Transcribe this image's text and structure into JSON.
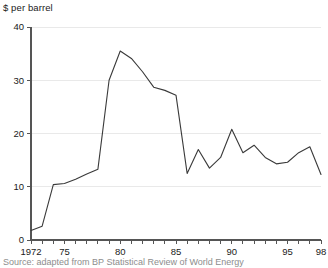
{
  "chart_data": {
    "type": "line",
    "title": "",
    "subtitle": "",
    "ylabel": "$ per barrel",
    "xlabel": "",
    "ylim": [
      0,
      40
    ],
    "xlim": [
      1972,
      1998
    ],
    "yticks": [
      0,
      10,
      20,
      30,
      40
    ],
    "ytick_labels": [
      "0",
      "10",
      "20",
      "30",
      "40"
    ],
    "xticks": [
      1972,
      1975,
      1980,
      1985,
      1990,
      1995,
      1998
    ],
    "xtick_labels": [
      "1972",
      "75",
      "80",
      "85",
      "90",
      "95",
      "98"
    ],
    "x_minor_tick_every": 1,
    "grid": "horizontal",
    "legend": "none",
    "series": [
      {
        "name": "Crude oil price",
        "x": [
          1972,
          1973,
          1974,
          1975,
          1976,
          1977,
          1978,
          1979,
          1980,
          1981,
          1982,
          1983,
          1984,
          1985,
          1986,
          1987,
          1988,
          1989,
          1990,
          1991,
          1992,
          1993,
          1994,
          1995,
          1996,
          1997,
          1998
        ],
        "values": [
          1.8,
          2.6,
          10.4,
          10.6,
          11.4,
          12.4,
          13.3,
          30.0,
          35.5,
          34.1,
          31.6,
          28.7,
          28.1,
          27.2,
          12.5,
          17.0,
          13.5,
          15.5,
          20.8,
          16.4,
          17.8,
          15.5,
          14.3,
          14.6,
          16.4,
          17.5,
          12.3
        ]
      }
    ],
    "source_note": "Source: adapted from BP Statistical Review of World Energy"
  },
  "axis": {
    "y_axis_title": "$ per barrel"
  },
  "colors": {
    "line": "#3a3a3a",
    "grid": "#e9e9e9",
    "axis": "#555555",
    "text": "#1a1a1a",
    "source_text": "#8d8d8d",
    "background": "#ffffff"
  }
}
